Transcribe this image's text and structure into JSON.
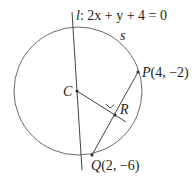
{
  "diagram": {
    "line_label": "l",
    "line_equation": ": 2x + y + 4 = 0",
    "arc_label": "s",
    "points": {
      "C": {
        "name": "C",
        "coords": ""
      },
      "P": {
        "name": "P",
        "coords": "(4, −2)"
      },
      "Q": {
        "name": "Q",
        "coords": "(2, −6)"
      },
      "R": {
        "name": "R",
        "coords": ""
      }
    },
    "colors": {
      "stroke": "#555555",
      "text": "#231f20"
    }
  }
}
